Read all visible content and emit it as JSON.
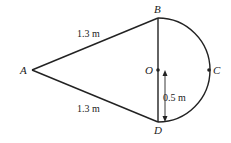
{
  "diagram": {
    "points": {
      "A": {
        "label": "A"
      },
      "B": {
        "label": "B"
      },
      "C": {
        "label": "C"
      },
      "D": {
        "label": "D"
      },
      "O": {
        "label": "O"
      }
    },
    "measurements": {
      "AB": "1.3 m",
      "AD": "1.3 m",
      "radius": "0.5 m"
    },
    "colors": {
      "stroke": "#222222",
      "background": "#ffffff"
    }
  }
}
